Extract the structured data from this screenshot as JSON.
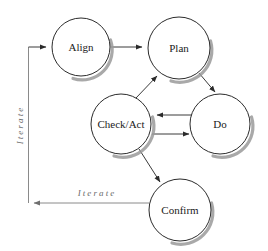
{
  "diagram": {
    "background_color": "#ffffff",
    "node_fill": "#ffffff",
    "node_stroke": "#2b2b2b",
    "shadow_color": "#9a9a9a",
    "connector_color": "#3a3a3a",
    "faint_connector_color": "#8a8a8a",
    "label_color": "#1a1a1a",
    "edge_label_color": "#6b6b6b",
    "nodes": [
      {
        "id": "align",
        "label": "Align",
        "cx": 81,
        "cy": 47,
        "r": 29
      },
      {
        "id": "plan",
        "label": "Plan",
        "cx": 179,
        "cy": 48,
        "r": 31
      },
      {
        "id": "check_act",
        "label": "Check/Act",
        "cx": 121,
        "cy": 124,
        "r": 30
      },
      {
        "id": "do",
        "label": "Do",
        "cx": 220,
        "cy": 124,
        "r": 30
      },
      {
        "id": "confirm",
        "label": "Confirm",
        "cx": 180,
        "cy": 210,
        "r": 31
      }
    ],
    "edges": [
      {
        "id": "align-to-plan",
        "from": "align",
        "to": "plan",
        "label": ""
      },
      {
        "id": "plan-to-do",
        "from": "plan",
        "to": "do",
        "label": ""
      },
      {
        "id": "do-to-check-act",
        "from": "do",
        "to": "check_act",
        "label": ""
      },
      {
        "id": "check-act-to-do",
        "from": "check_act",
        "to": "do",
        "label": ""
      },
      {
        "id": "check-act-to-plan",
        "from": "check_act",
        "to": "plan",
        "label": ""
      },
      {
        "id": "check-act-to-confirm",
        "from": "check_act",
        "to": "confirm",
        "label": ""
      },
      {
        "id": "confirm-to-align",
        "from": "confirm",
        "to": "align",
        "label": "Iterate"
      }
    ],
    "edge_labels": {
      "vertical_iterate": "Iterate",
      "horizontal_iterate": "Iterate"
    }
  }
}
